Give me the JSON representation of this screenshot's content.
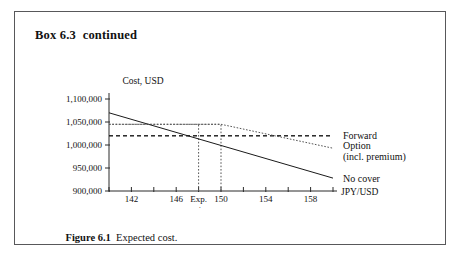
{
  "box": {
    "title": "Box 6.3  continued"
  },
  "caption": {
    "number": "Figure 6.1",
    "text": "Expected cost."
  },
  "chart_data": {
    "type": "line",
    "title": "",
    "ylabel": "Cost, USD",
    "xlabel": "JPY/USD",
    "xlim": [
      140,
      160
    ],
    "ylim": [
      900000,
      1100000
    ],
    "grid": false,
    "legend_position": "right-inline",
    "x_ticks": [
      140,
      142,
      144,
      146,
      148,
      150,
      152,
      154,
      156,
      158,
      160
    ],
    "x_tick_labels": [
      "",
      "142",
      "",
      "146",
      "Exp.\nrate",
      "150",
      "",
      "154",
      "",
      "158",
      ""
    ],
    "y_ticks": [
      900000,
      950000,
      1000000,
      1050000,
      1100000
    ],
    "y_tick_labels": [
      "900,000",
      "950,000",
      "1,000,000",
      "1,050,000",
      "1,100,000"
    ],
    "annotations": [
      {
        "name": "expected-rate-marker",
        "x": 148,
        "label": "Exp. rate"
      },
      {
        "name": "strike-marker",
        "x": 150,
        "label": "150"
      }
    ],
    "series": [
      {
        "name": "No cover",
        "style": "solid",
        "label": "No cover",
        "points": [
          [
            140,
            1070000
          ],
          [
            160,
            928000
          ]
        ]
      },
      {
        "name": "Forward",
        "style": "dashed",
        "label": "Forward",
        "points": [
          [
            140,
            1020000
          ],
          [
            160,
            1020000
          ]
        ]
      },
      {
        "name": "Option (incl. premium)",
        "style": "dotted",
        "label_line1": "Option",
        "label_line2": "(incl. premium)",
        "points": [
          [
            140,
            1045000
          ],
          [
            150,
            1045000
          ],
          [
            160,
            993000
          ]
        ]
      }
    ],
    "reference_lines": [
      {
        "name": "option-level",
        "y": 1045000,
        "from_x": 140,
        "to_x": 150,
        "style": "dotted"
      },
      {
        "name": "forward-level",
        "y": 1020000,
        "from_x": 140,
        "to_x": 160,
        "style": "dashed"
      },
      {
        "name": "exp-rate-drop",
        "x": 148,
        "from_y": 900000,
        "to_y": 1045000,
        "style": "dotted"
      },
      {
        "name": "strike-drop",
        "x": 150,
        "from_y": 900000,
        "to_y": 1045000,
        "style": "dotted"
      }
    ]
  },
  "colors": {
    "border": "#58585a",
    "ink": "#111111",
    "line": "#1a1a1a",
    "dotted": "#555555",
    "background": "#ffffff"
  }
}
